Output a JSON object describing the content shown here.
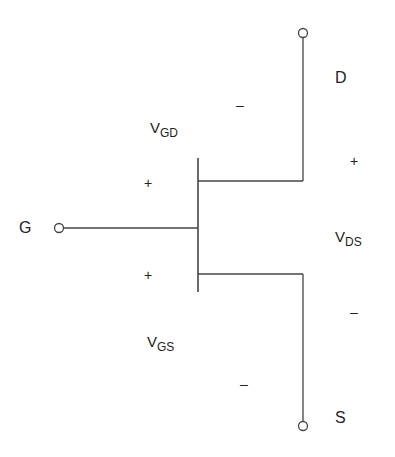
{
  "diagram": {
    "type": "circuit-symbol",
    "stroke_color": "#444444",
    "terminals": {
      "drain": {
        "label": "D"
      },
      "gate": {
        "label": "G"
      },
      "source": {
        "label": "S"
      }
    },
    "voltages": {
      "vgd": {
        "main": "V",
        "sub": "GD",
        "plus": "+",
        "minus": "–"
      },
      "vgs": {
        "main": "V",
        "sub": "GS",
        "plus": "+",
        "minus": "–"
      },
      "vds": {
        "main": "V",
        "sub": "DS",
        "plus": "+",
        "minus": "–"
      }
    }
  }
}
